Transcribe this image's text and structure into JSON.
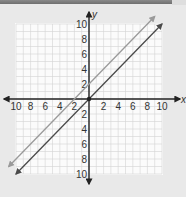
{
  "chart_data": {
    "type": "line",
    "title": "",
    "xlabel": "x",
    "ylabel": "y",
    "xlim": [
      -10,
      10
    ],
    "ylim": [
      -10,
      10
    ],
    "grid": true,
    "x_ticks": [
      -10,
      -8,
      -6,
      -4,
      -2,
      2,
      4,
      6,
      8,
      10
    ],
    "x_tick_labels": [
      "10",
      "8",
      "6",
      "4",
      "2",
      "2",
      "4",
      "6",
      "8",
      "10"
    ],
    "y_ticks": [
      10,
      8,
      6,
      4,
      2,
      -2,
      -4,
      -6,
      -8,
      -10
    ],
    "y_tick_labels": [
      "10",
      "8",
      "6",
      "4",
      "2",
      "2",
      "4",
      "6",
      "8",
      "10"
    ],
    "series": [
      {
        "name": "line-1",
        "equation": "y = x + 2",
        "color": "#9a9a9a",
        "points": [
          [
            -11,
            -9
          ],
          [
            9,
            11
          ]
        ]
      },
      {
        "name": "line-2",
        "equation": "y = x",
        "color": "#4a4a4a",
        "points": [
          [
            -10,
            -10
          ],
          [
            10,
            10
          ]
        ]
      }
    ],
    "legend": "none"
  },
  "colors": {
    "background": "#e9e9e9",
    "plot_area": "#fbfbfb",
    "grid": "#d4d4d4",
    "axis": "#222222"
  }
}
